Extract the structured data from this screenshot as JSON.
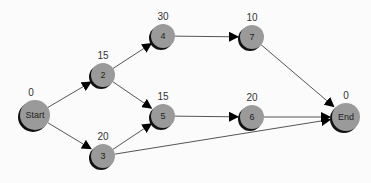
{
  "diagram": {
    "type": "network-flow-graph",
    "colors": {
      "node_fill": "#9a9a9a",
      "node_shadow": "#111111",
      "edge": "#555555",
      "background": "#fbfbfb"
    },
    "nodes": [
      {
        "id": "start",
        "label": "Start",
        "value": "0",
        "x": 35,
        "y": 115,
        "r": 15
      },
      {
        "id": "n2",
        "label": "2",
        "value": "15",
        "x": 103,
        "y": 75,
        "r": 12
      },
      {
        "id": "n3",
        "label": "3",
        "value": "20",
        "x": 103,
        "y": 156,
        "r": 12
      },
      {
        "id": "n4",
        "label": "4",
        "value": "30",
        "x": 163,
        "y": 36,
        "r": 12
      },
      {
        "id": "n5",
        "label": "5",
        "value": "15",
        "x": 163,
        "y": 116,
        "r": 12
      },
      {
        "id": "n6",
        "label": "6",
        "value": "20",
        "x": 252,
        "y": 117,
        "r": 12
      },
      {
        "id": "n7",
        "label": "7",
        "value": "10",
        "x": 252,
        "y": 37,
        "r": 12
      },
      {
        "id": "end",
        "label": "End",
        "value": "0",
        "x": 346,
        "y": 117,
        "r": 14
      }
    ],
    "edges": [
      {
        "from": "start",
        "to": "n2"
      },
      {
        "from": "start",
        "to": "n3"
      },
      {
        "from": "n2",
        "to": "n4"
      },
      {
        "from": "n2",
        "to": "n5"
      },
      {
        "from": "n3",
        "to": "n5"
      },
      {
        "from": "n3",
        "to": "end"
      },
      {
        "from": "n4",
        "to": "n7"
      },
      {
        "from": "n5",
        "to": "n6"
      },
      {
        "from": "n6",
        "to": "end"
      },
      {
        "from": "n7",
        "to": "end"
      }
    ]
  }
}
